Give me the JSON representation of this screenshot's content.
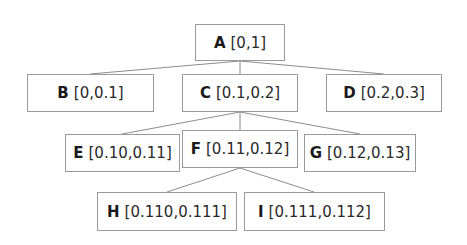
{
  "diagram": {
    "type": "tree",
    "colors": {
      "edge": "#8c8c8c",
      "border": "#9a9a9a",
      "text": "#222222",
      "background": "#ffffff"
    },
    "nodes": [
      {
        "id": "A",
        "key": "A",
        "range": "[0,1]",
        "box": [
          195,
          24,
          90,
          37
        ]
      },
      {
        "id": "B",
        "key": "B",
        "range": "[0,0.1]",
        "box": [
          27,
          74,
          127,
          38
        ]
      },
      {
        "id": "C",
        "key": "C",
        "range": "[0.1,0.2]",
        "box": [
          182,
          74,
          116,
          38
        ]
      },
      {
        "id": "D",
        "key": "D",
        "range": "[0.2,0.3]",
        "box": [
          326,
          74,
          116,
          38
        ]
      },
      {
        "id": "E",
        "key": "E",
        "range": "[0.10,0.11]",
        "box": [
          65,
          134,
          115,
          38
        ]
      },
      {
        "id": "F",
        "key": "F",
        "range": "[0.11,0.12]",
        "box": [
          182,
          130,
          116,
          38
        ]
      },
      {
        "id": "G",
        "key": "G",
        "range": "[0.12,0.13]",
        "box": [
          304,
          134,
          112,
          38
        ]
      },
      {
        "id": "H",
        "key": "H",
        "range": "[0.110,0.111]",
        "box": [
          97,
          192,
          140,
          39
        ]
      },
      {
        "id": "I",
        "key": "I",
        "range": "[0.111,0.112]",
        "box": [
          244,
          192,
          141,
          39
        ]
      }
    ],
    "edges": [
      {
        "from": "A",
        "to": "B"
      },
      {
        "from": "A",
        "to": "C"
      },
      {
        "from": "A",
        "to": "D"
      },
      {
        "from": "C",
        "to": "E"
      },
      {
        "from": "C",
        "to": "F"
      },
      {
        "from": "C",
        "to": "G"
      },
      {
        "from": "F",
        "to": "H"
      },
      {
        "from": "F",
        "to": "I"
      }
    ]
  }
}
